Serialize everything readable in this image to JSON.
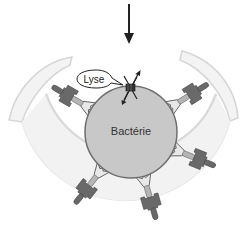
{
  "diagram": {
    "labels": {
      "bacterium": "Bactérie",
      "lysis": "Lyse"
    },
    "elements": {
      "arrow": {
        "direction": "down",
        "x": 129,
        "y_start": 4,
        "y_end": 40
      },
      "outer_cell": {
        "shape": "open-ring",
        "color": "#d9d9d9",
        "cx": 131,
        "cy": 134,
        "r": 90
      },
      "bacterium": {
        "shape": "circle",
        "cx": 131,
        "cy": 132,
        "r": 46,
        "fill": "#c9c9c9",
        "stroke": "#6b6b6b"
      },
      "lysis_site": {
        "x": 130,
        "y": 87
      },
      "antibodies": {
        "count": 6,
        "angles_deg": [
          208,
          340,
          25,
          130,
          95,
          62
        ]
      }
    },
    "colors": {
      "background": "#ffffff",
      "membrane_outline": "#dadada",
      "bacterium_fill": "#c8c8c8",
      "bacterium_stroke": "#6e6e6e",
      "receptor_dark": "#6a6a6a",
      "receptor_light": "#b8b8b8",
      "antibody_fill": "#e6e6e6"
    }
  }
}
